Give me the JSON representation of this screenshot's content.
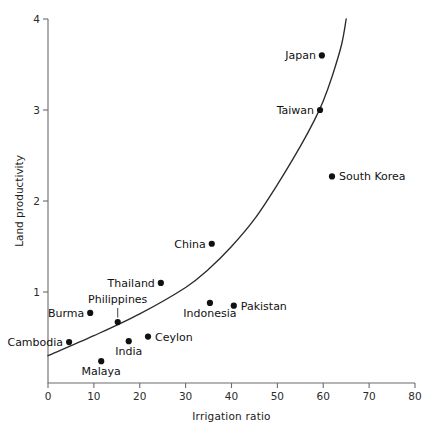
{
  "chart_data": {
    "type": "scatter",
    "title": "",
    "xlabel": "Irrigation  ratio",
    "ylabel": "Land productivity",
    "xlim": [
      0,
      80
    ],
    "ylim": [
      0,
      4
    ],
    "xticks": [
      "0",
      "10",
      "20",
      "30",
      "40",
      "50",
      "60",
      "70",
      "80"
    ],
    "yticks": [
      "1",
      "2",
      "3",
      "4"
    ],
    "grid": false,
    "legend": "none",
    "point_color": "#111111",
    "curve_color": "#2b2b2b",
    "points": [
      {
        "label": "Cambodia",
        "x": 4.6,
        "y": 0.45,
        "anchor": "anchor-end",
        "leader": false
      },
      {
        "label": "Burma",
        "x": 9.2,
        "y": 0.77,
        "anchor": "anchor-end",
        "leader": false
      },
      {
        "label": "Malaya",
        "x": 11.6,
        "y": 0.24,
        "anchor": "anchor-below",
        "leader": false
      },
      {
        "label": "Philippines",
        "x": 15.2,
        "y": 0.67,
        "anchor": "anchor-above",
        "leader": true
      },
      {
        "label": "India",
        "x": 17.6,
        "y": 0.46,
        "anchor": "anchor-below",
        "leader": false
      },
      {
        "label": "Ceylon",
        "x": 21.8,
        "y": 0.51,
        "anchor": "anchor-start",
        "leader": false
      },
      {
        "label": "Thailand",
        "x": 24.6,
        "y": 1.1,
        "anchor": "anchor-end",
        "leader": false
      },
      {
        "label": "Indonesia",
        "x": 35.3,
        "y": 0.88,
        "anchor": "anchor-below",
        "leader": false
      },
      {
        "label": "China",
        "x": 35.7,
        "y": 1.53,
        "anchor": "anchor-end",
        "leader": false
      },
      {
        "label": "Pakistan",
        "x": 40.5,
        "y": 0.85,
        "anchor": "anchor-start",
        "leader": false
      },
      {
        "label": "Taiwan",
        "x": 59.3,
        "y": 3.0,
        "anchor": "anchor-end",
        "leader": false
      },
      {
        "label": "Japan",
        "x": 59.7,
        "y": 3.6,
        "anchor": "anchor-end",
        "leader": false
      },
      {
        "label": "South Korea",
        "x": 61.9,
        "y": 2.27,
        "anchor": "anchor-start",
        "leader": false
      }
    ],
    "fit_curve": {
      "description": "smooth exponential-like trend line rising from left to right",
      "samples": [
        {
          "x": 0,
          "y": 0.3
        },
        {
          "x": 10,
          "y": 0.52
        },
        {
          "x": 20,
          "y": 0.76
        },
        {
          "x": 30,
          "y": 1.05
        },
        {
          "x": 35,
          "y": 1.25
        },
        {
          "x": 40,
          "y": 1.5
        },
        {
          "x": 45,
          "y": 1.8
        },
        {
          "x": 50,
          "y": 2.18
        },
        {
          "x": 55,
          "y": 2.6
        },
        {
          "x": 58,
          "y": 2.88
        },
        {
          "x": 60,
          "y": 3.1
        },
        {
          "x": 62,
          "y": 3.38
        },
        {
          "x": 64,
          "y": 3.72
        },
        {
          "x": 65,
          "y": 4.0
        }
      ]
    }
  }
}
